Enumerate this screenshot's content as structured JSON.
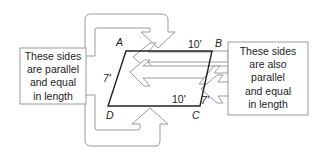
{
  "diagram": {
    "type": "parallelogram-annotation",
    "vertices": [
      {
        "id": "A",
        "label": "A"
      },
      {
        "id": "B",
        "label": "B"
      },
      {
        "id": "C",
        "label": "C"
      },
      {
        "id": "D",
        "label": "D"
      }
    ],
    "side_labels": {
      "top": "10'",
      "bottom": "10'",
      "left": "7'",
      "right": "7'"
    },
    "callouts": {
      "left": {
        "lines": [
          "These sides",
          "are parallel",
          "and equal",
          "in length"
        ],
        "refers_to": [
          "AB",
          "DC"
        ]
      },
      "right": {
        "lines": [
          "These sides",
          "are also",
          "parallel",
          "and equal",
          "in length"
        ],
        "refers_to": [
          "AD",
          "BC"
        ]
      }
    },
    "colors": {
      "outline": "#222222",
      "arrow_stroke": "#9a9a9a",
      "arrow_fill": "#ffffff",
      "box_stroke": "#9a9a9a"
    }
  }
}
